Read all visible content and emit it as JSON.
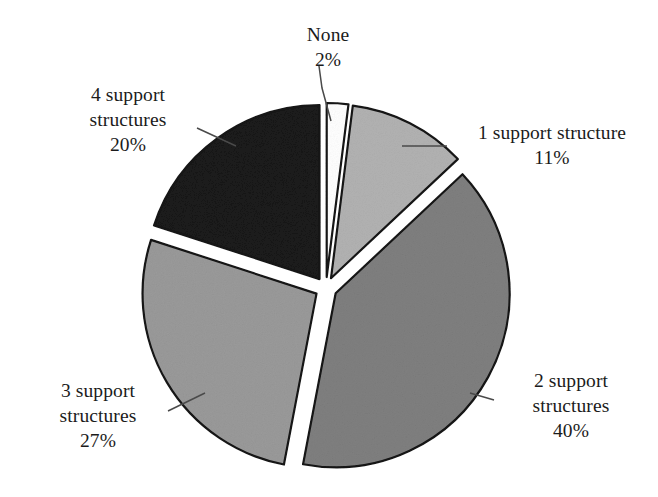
{
  "chart_data": {
    "type": "pie",
    "title": "",
    "subtitle": "",
    "xlabel": "",
    "ylabel": "",
    "exploded": true,
    "legend_position": "none",
    "labels_style": "callout-with-leader-lines",
    "categories": [
      "None",
      "1 support structure",
      "2 support structures",
      "3 support structures",
      "4 support structures"
    ],
    "values": [
      2,
      11,
      40,
      27,
      20
    ],
    "value_labels": [
      "2%",
      "11%",
      "40%",
      "27%",
      "20%"
    ],
    "units": "percent",
    "total": 100,
    "slices": [
      {
        "name": "None",
        "label_line1": "None",
        "label_line2": "2%",
        "value": 2,
        "value_label": "2%",
        "color": "#ffffff",
        "stroke": "#141414",
        "start_angle_deg": 0,
        "end_angle_deg": 7.2
      },
      {
        "name": "1 support structure",
        "label_line1": "1 support structure",
        "label_line2": "11%",
        "value": 11,
        "value_label": "11%",
        "color": "#b2b2b2",
        "stroke": "#141414",
        "start_angle_deg": 7.2,
        "end_angle_deg": 46.8
      },
      {
        "name": "2 support structures",
        "label_line1": "2 support",
        "label_line2": "structures",
        "label_line3": "40%",
        "value": 40,
        "value_label": "40%",
        "color": "#7f7f7f",
        "stroke": "#141414",
        "start_angle_deg": 46.8,
        "end_angle_deg": 190.8
      },
      {
        "name": "3 support structures",
        "label_line1": "3 support",
        "label_line2": "structures",
        "label_line3": "27%",
        "value": 27,
        "value_label": "27%",
        "color": "#9a9a9a",
        "stroke": "#141414",
        "start_angle_deg": 190.8,
        "end_angle_deg": 288.0
      },
      {
        "name": "4 support structures",
        "label_line1": "4 support",
        "label_line2": "structures",
        "label_line3": "20%",
        "value": 20,
        "value_label": "20%",
        "color": "#1a1a1a",
        "stroke": "#141414",
        "start_angle_deg": 288.0,
        "end_angle_deg": 360.0
      }
    ],
    "geometry": {
      "center_x": 326,
      "center_y": 288,
      "radius": 174
    },
    "colors": {
      "background": "#ffffff",
      "outline": "#141414",
      "text": "#1b1b1b",
      "leader_line": "#4a4a4a"
    }
  },
  "labels": {
    "none": {
      "line1": "None",
      "line2": "2%"
    },
    "one": {
      "line1": "1 support structure",
      "line2": "11%"
    },
    "two": {
      "line1": "2 support",
      "line2": "structures",
      "line3": "40%"
    },
    "three": {
      "line1": "3 support",
      "line2": "structures",
      "line3": "27%"
    },
    "four": {
      "line1": "4 support",
      "line2": "structures",
      "line3": "20%"
    }
  }
}
